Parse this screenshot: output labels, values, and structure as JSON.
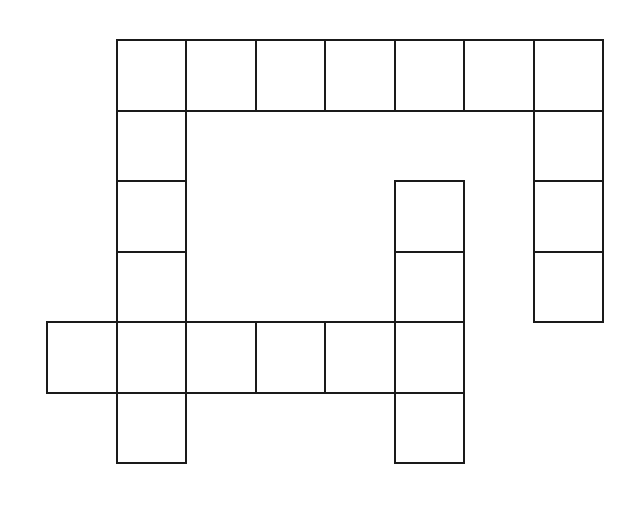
{
  "image": {
    "type": "crossword-grid",
    "description": "Blank crossword puzzle grid",
    "background_color": "#ffffff",
    "line_color": "#1a1a1a",
    "width": 627,
    "height": 509
  },
  "grid": {
    "columns": 8,
    "rows": 6,
    "cell_width": 69.5,
    "cell_height": 70.5,
    "origin_x": 46,
    "origin_y": 39,
    "line_width": 2,
    "total_cells": 25,
    "column_x": [
      46,
      115.5,
      185,
      254.5,
      324,
      393.5,
      463,
      532.5
    ],
    "row_y": [
      39,
      109.5,
      180,
      250.5,
      321,
      391.5
    ],
    "cells": [
      {
        "row": 0,
        "col": 1,
        "label": ""
      },
      {
        "row": 0,
        "col": 2,
        "label": ""
      },
      {
        "row": 0,
        "col": 3,
        "label": ""
      },
      {
        "row": 0,
        "col": 4,
        "label": ""
      },
      {
        "row": 0,
        "col": 5,
        "label": ""
      },
      {
        "row": 0,
        "col": 6,
        "label": ""
      },
      {
        "row": 0,
        "col": 7,
        "label": ""
      },
      {
        "row": 1,
        "col": 1,
        "label": ""
      },
      {
        "row": 1,
        "col": 7,
        "label": ""
      },
      {
        "row": 2,
        "col": 1,
        "label": ""
      },
      {
        "row": 2,
        "col": 5,
        "label": ""
      },
      {
        "row": 2,
        "col": 7,
        "label": ""
      },
      {
        "row": 3,
        "col": 1,
        "label": ""
      },
      {
        "row": 3,
        "col": 5,
        "label": ""
      },
      {
        "row": 3,
        "col": 7,
        "label": ""
      },
      {
        "row": 4,
        "col": 0,
        "label": ""
      },
      {
        "row": 4,
        "col": 1,
        "label": ""
      },
      {
        "row": 4,
        "col": 2,
        "label": ""
      },
      {
        "row": 4,
        "col": 3,
        "label": ""
      },
      {
        "row": 4,
        "col": 4,
        "label": ""
      },
      {
        "row": 4,
        "col": 5,
        "label": ""
      },
      {
        "row": 5,
        "col": 1,
        "label": ""
      },
      {
        "row": 5,
        "col": 5,
        "label": ""
      }
    ]
  }
}
